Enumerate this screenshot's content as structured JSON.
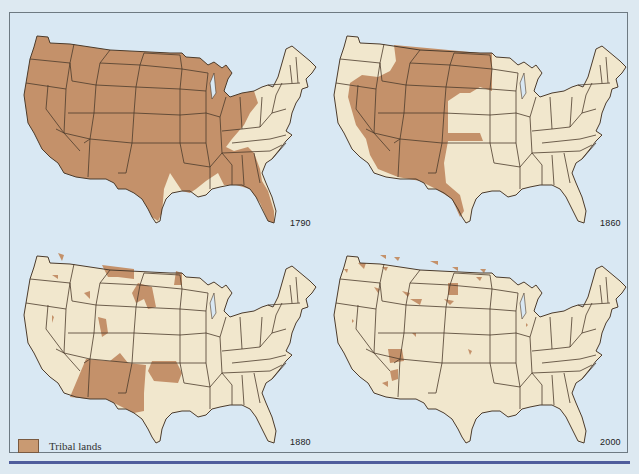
{
  "figure": {
    "type": "map-small-multiples"
  },
  "colors": {
    "page_background": "#dde9f1",
    "map_water": "#d9e8f3",
    "land": "#f1e7cd",
    "tribal_lands": "#c4916a",
    "state_borders": "#4b3b2c",
    "bottom_rule": "#4f5d9c"
  },
  "panels": [
    {
      "year": "1790",
      "position": "top-left",
      "tribal_extent": "nearly all land west of the Appalachians plus Georgia/Florida; east coast and east Texas/Louisiana not tribal"
    },
    {
      "year": "1860",
      "position": "top-right",
      "tribal_extent": "Great Plains, Great Basin, Southwest and west Texas"
    },
    {
      "year": "1880",
      "position": "bottom-left",
      "tribal_extent": "scattered reservations; large blocks in Arizona, New Mexico, Oklahoma, Dakotas, Montana"
    },
    {
      "year": "2000",
      "position": "bottom-right",
      "tribal_extent": "small scattered reservations; largest in Arizona (Navajo)"
    }
  ],
  "legend": {
    "items": [
      {
        "label": "Tribal lands",
        "color": "#c4916a"
      }
    ]
  }
}
